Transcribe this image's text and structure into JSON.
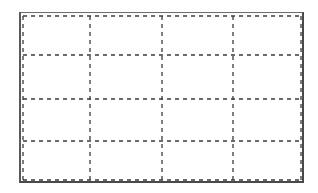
{
  "diagram": {
    "type": "grid-wireframe",
    "columns": 4,
    "rows": 4,
    "line_style": "dashed",
    "line_color": "#3a3a3a",
    "frame_color": "#4a4a4a",
    "background": "#ffffff",
    "inner_rect": {
      "x1": 23,
      "y1": 16,
      "x2": 301,
      "y2": 180
    },
    "vertical_lines_x": [
      90,
      162,
      233
    ],
    "horizontal_lines_y": [
      55,
      99,
      141
    ]
  }
}
